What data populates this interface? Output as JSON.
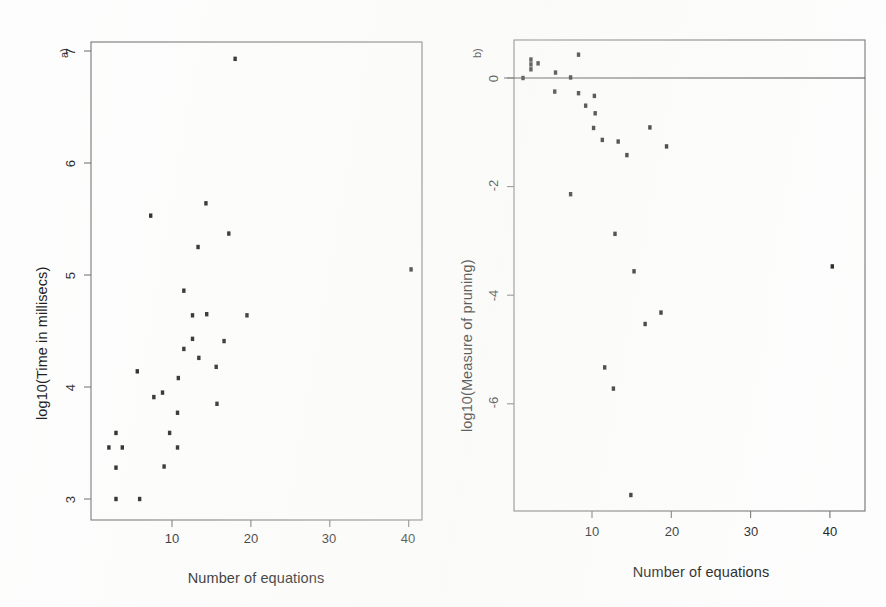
{
  "figure": {
    "background_color": "#fdfdfd",
    "point_color": "#1a1a1a",
    "axis_color": "#6e6e6e",
    "width": 886,
    "height": 607
  },
  "panels": [
    {
      "tag": "a)",
      "xlabel": "Number of equations",
      "ylabel": "log10(Time in millisecs)",
      "xticks": [
        "10",
        "20",
        "30",
        "40"
      ],
      "yticks": [
        "7",
        "6",
        "5",
        "4",
        "3"
      ]
    },
    {
      "tag": "b)",
      "xlabel": "Number of equations",
      "ylabel": "log10(Measure of pruning)",
      "xticks": [
        "10",
        "20",
        "30",
        "40"
      ],
      "yticks": [
        "0",
        "-2",
        "-4",
        "-6"
      ]
    }
  ],
  "chart_data": [
    {
      "type": "scatter",
      "panel": "a)",
      "title": "",
      "xlabel": "Number of equations",
      "ylabel": "log10(Time in millisecs)",
      "xlim": [
        1.0,
        42.0
      ],
      "ylim": [
        2.88,
        7.18
      ],
      "xticks": [
        10,
        20,
        30,
        40
      ],
      "yticks": [
        3,
        4,
        5,
        6,
        7
      ],
      "grid": false,
      "legend": null,
      "marker": "filled-square",
      "points": [
        {
          "x": 18.0,
          "y": 6.93
        },
        {
          "x": 7.3,
          "y": 5.53
        },
        {
          "x": 14.3,
          "y": 5.64
        },
        {
          "x": 17.2,
          "y": 5.37
        },
        {
          "x": 13.3,
          "y": 5.25
        },
        {
          "x": 40.3,
          "y": 5.05
        },
        {
          "x": 11.5,
          "y": 4.86
        },
        {
          "x": 12.6,
          "y": 4.64
        },
        {
          "x": 14.4,
          "y": 4.65
        },
        {
          "x": 19.5,
          "y": 4.64
        },
        {
          "x": 12.6,
          "y": 4.43
        },
        {
          "x": 16.6,
          "y": 4.41
        },
        {
          "x": 11.5,
          "y": 4.34
        },
        {
          "x": 13.4,
          "y": 4.26
        },
        {
          "x": 15.6,
          "y": 4.18
        },
        {
          "x": 5.6,
          "y": 4.14
        },
        {
          "x": 10.8,
          "y": 4.08
        },
        {
          "x": 8.8,
          "y": 3.95
        },
        {
          "x": 7.7,
          "y": 3.91
        },
        {
          "x": 15.7,
          "y": 3.85
        },
        {
          "x": 10.7,
          "y": 3.77
        },
        {
          "x": 2.9,
          "y": 3.59
        },
        {
          "x": 9.7,
          "y": 3.59
        },
        {
          "x": 2.0,
          "y": 3.46
        },
        {
          "x": 3.7,
          "y": 3.46
        },
        {
          "x": 10.7,
          "y": 3.46
        },
        {
          "x": 2.9,
          "y": 3.28
        },
        {
          "x": 9.0,
          "y": 3.29
        },
        {
          "x": 2.9,
          "y": 3.0
        },
        {
          "x": 5.9,
          "y": 3.0
        }
      ]
    },
    {
      "type": "scatter",
      "panel": "b)",
      "title": "",
      "xlabel": "Number of equations",
      "ylabel": "log10(Measure of pruning)",
      "xlim": [
        1.0,
        42.0
      ],
      "ylim": [
        -7.98,
        0.7
      ],
      "xticks": [
        10,
        20,
        30,
        40
      ],
      "yticks": [
        0,
        -2,
        -4,
        -6
      ],
      "grid": false,
      "legend": null,
      "marker": "filled-square",
      "reference_line": {
        "type": "horizontal",
        "y": 0.0
      },
      "points": [
        {
          "x": 1.3,
          "y": 0.0
        },
        {
          "x": 2.3,
          "y": 0.34
        },
        {
          "x": 2.3,
          "y": 0.25
        },
        {
          "x": 2.3,
          "y": 0.16
        },
        {
          "x": 3.2,
          "y": 0.27
        },
        {
          "x": 5.4,
          "y": 0.1
        },
        {
          "x": 5.3,
          "y": -0.25
        },
        {
          "x": 7.3,
          "y": 0.01
        },
        {
          "x": 8.3,
          "y": 0.43
        },
        {
          "x": 8.3,
          "y": -0.28
        },
        {
          "x": 9.2,
          "y": -0.51
        },
        {
          "x": 10.3,
          "y": -0.33
        },
        {
          "x": 10.4,
          "y": -0.65
        },
        {
          "x": 10.2,
          "y": -0.92
        },
        {
          "x": 11.3,
          "y": -1.14
        },
        {
          "x": 13.3,
          "y": -1.17
        },
        {
          "x": 14.4,
          "y": -1.42
        },
        {
          "x": 17.3,
          "y": -0.91
        },
        {
          "x": 19.4,
          "y": -1.26
        },
        {
          "x": 7.3,
          "y": -2.14
        },
        {
          "x": 12.9,
          "y": -2.87
        },
        {
          "x": 15.3,
          "y": -3.56
        },
        {
          "x": 40.3,
          "y": -3.47
        },
        {
          "x": 18.7,
          "y": -4.32
        },
        {
          "x": 16.7,
          "y": -4.53
        },
        {
          "x": 11.6,
          "y": -5.33
        },
        {
          "x": 12.7,
          "y": -5.72
        },
        {
          "x": 14.9,
          "y": -7.68
        }
      ]
    }
  ]
}
